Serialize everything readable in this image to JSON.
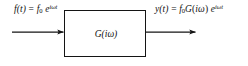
{
  "diagram": {
    "type": "block-diagram",
    "background_color": "#ffffff",
    "stroke_color": "#141414",
    "input_signal": {
      "lhs_function": "f",
      "lhs_variable": "t",
      "lhs": "f(t)",
      "equals": "=",
      "amplitude": "f",
      "amplitude_subscript": "0",
      "exponential_base": "e",
      "exponential_exponent": "iωt",
      "full_text": "f(t) = f₀ e^{iωt}"
    },
    "system_block": {
      "label_function": "G",
      "label_argument": "iω",
      "label_text": "G(iω)",
      "shape": "rectangle"
    },
    "output_signal": {
      "lhs_function": "y",
      "lhs_variable": "t",
      "lhs": "y(t)",
      "equals": "=",
      "amplitude": "f",
      "amplitude_subscript": "0",
      "transfer_function": "G",
      "transfer_argument": "iω",
      "exponential_base": "e",
      "exponential_exponent": "iωt",
      "full_text": "y(t) = f₀G(iω) e^{iωt}"
    },
    "input_arrow": {
      "name": "input-arrow",
      "direction": "right",
      "x_start": 12,
      "x_end": 64,
      "y": 32
    },
    "output_arrow": {
      "name": "output-arrow",
      "direction": "right",
      "x_start": 146,
      "x_end": 196,
      "y": 32
    }
  }
}
